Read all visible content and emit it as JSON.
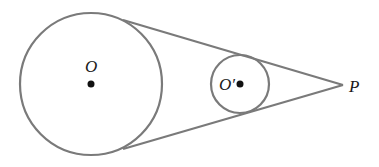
{
  "diagram": {
    "type": "geometry-tangent-circles",
    "colors": {
      "stroke": "#7a7a7a",
      "point": "#111111",
      "background": "#ffffff"
    },
    "big_circle": {
      "label": "O",
      "cx": 91,
      "cy": 84,
      "r": 71
    },
    "small_circle": {
      "label": "O′",
      "cx": 240,
      "cy": 84,
      "r": 29
    },
    "external_point": {
      "label": "P",
      "x": 343,
      "y": 85
    },
    "tangent_lines": [
      {
        "from": [
          124,
          21
        ],
        "to": [
          343,
          85
        ]
      },
      {
        "from": [
          124,
          147
        ],
        "to": [
          343,
          85
        ]
      }
    ]
  }
}
